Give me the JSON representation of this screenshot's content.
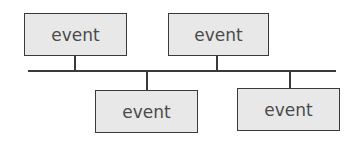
{
  "diagram": {
    "type": "timeline",
    "colors": {
      "line": "#3a3a3a",
      "box_fill": "#e8e8e8",
      "text": "#4a4a4a"
    },
    "timeline": {
      "x1": 28,
      "x2": 336,
      "y": 71
    },
    "events": [
      {
        "label": "event",
        "position": "above",
        "x": 24,
        "y": 13,
        "w": 103,
        "h": 43,
        "stem_x": 74
      },
      {
        "label": "event",
        "position": "above",
        "x": 168,
        "y": 13,
        "w": 101,
        "h": 43,
        "stem_x": 216
      },
      {
        "label": "event",
        "position": "below",
        "x": 95,
        "y": 90,
        "w": 103,
        "h": 43,
        "stem_x": 146
      },
      {
        "label": "event",
        "position": "below",
        "x": 237,
        "y": 88,
        "w": 103,
        "h": 43,
        "stem_x": 289
      }
    ]
  }
}
